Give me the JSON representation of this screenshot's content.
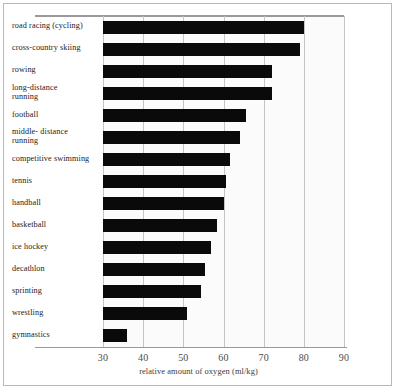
{
  "chart_data": {
    "type": "bar",
    "orientation": "horizontal",
    "title": "",
    "xlabel": "relative amount of oxygen (ml/kg)",
    "ylabel": "",
    "xlim": [
      30,
      90
    ],
    "xticks": [
      30,
      40,
      50,
      60,
      70,
      80,
      90
    ],
    "xtick_labels": [
      "30",
      "40",
      "50",
      "60",
      "70",
      "80",
      "90"
    ],
    "grid": "vertical",
    "legend": "none",
    "bar_color": "#0a0a0a",
    "categories": [
      "road racing (cycling)",
      "cross-country skiing",
      "rowing",
      "long-distance running",
      "football",
      "middle- distance running",
      "competitive swimming",
      "tennis",
      "handball",
      "basketball",
      "ice hockey",
      "decathlon",
      "sprinting",
      "wrestling",
      "gymnastics"
    ],
    "values": [
      80,
      79,
      72,
      72,
      65.5,
      64,
      61.5,
      60.5,
      60,
      58.5,
      57,
      55.5,
      54.5,
      51,
      36
    ],
    "bars": [
      {
        "label": "road racing (cycling)",
        "label_lines": [
          "road racing (cycling)"
        ],
        "value": 80
      },
      {
        "label": "cross-country skiing",
        "label_lines": [
          "cross-country skiing"
        ],
        "value": 79
      },
      {
        "label": "rowing",
        "label_lines": [
          "rowing"
        ],
        "value": 72
      },
      {
        "label": "long-distance running",
        "label_lines": [
          "long-distance",
          "running"
        ],
        "value": 72
      },
      {
        "label": "football",
        "label_lines": [
          "football"
        ],
        "value": 65.5
      },
      {
        "label": "middle- distance running",
        "label_lines": [
          "middle- distance",
          "running"
        ],
        "value": 64
      },
      {
        "label": "competitive swimming",
        "label_lines": [
          "competitive swimming"
        ],
        "value": 61.5
      },
      {
        "label": "tennis",
        "label_lines": [
          "tennis"
        ],
        "value": 60.5
      },
      {
        "label": "handball",
        "label_lines": [
          "handball"
        ],
        "value": 60
      },
      {
        "label": "basketball",
        "label_lines": [
          "basketball"
        ],
        "value": 58.5
      },
      {
        "label": "ice hockey",
        "label_lines": [
          "ice hockey"
        ],
        "value": 57
      },
      {
        "label": "decathlon",
        "label_lines": [
          "decathlon"
        ],
        "value": 55.5
      },
      {
        "label": "sprinting",
        "label_lines": [
          "sprinting"
        ],
        "value": 54.5
      },
      {
        "label": "wrestling",
        "label_lines": [
          "wrestling"
        ],
        "value": 51
      },
      {
        "label": "gymnastics",
        "label_lines": [
          "gymnastics"
        ],
        "value": 36
      }
    ]
  }
}
